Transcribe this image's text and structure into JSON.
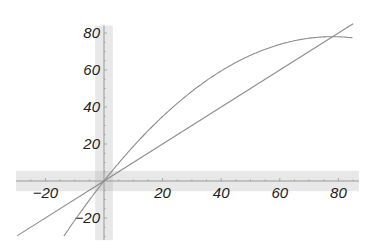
{
  "chart_data": {
    "type": "line",
    "title": "",
    "xlabel": "",
    "ylabel": "",
    "xlim": [
      -30,
      87
    ],
    "ylim": [
      -32,
      84
    ],
    "grid": false,
    "legend": null,
    "x_ticks": [
      -20,
      20,
      40,
      60,
      80
    ],
    "x_tick_labels": [
      "−20",
      "20",
      "40",
      "60",
      "80"
    ],
    "y_ticks": [
      -20,
      20,
      40,
      60,
      80
    ],
    "y_tick_labels": [
      "−20",
      "20",
      "40",
      "60",
      "80"
    ],
    "highlight_bands": [
      {
        "axis": "x",
        "from": -3,
        "to": 3,
        "color": "#e8e8e8"
      },
      {
        "axis": "y",
        "from": -5.5,
        "to": 5.5,
        "color": "#e8e8e8"
      }
    ],
    "series": [
      {
        "name": "line y = x",
        "style": "straight",
        "color": "#8c8c8c",
        "x": [
          -29.7,
          0,
          20,
          40,
          60,
          85
        ],
        "y": [
          -29.7,
          0,
          20,
          40,
          60,
          85
        ]
      },
      {
        "name": "curve y = 2x - x^2/78",
        "style": "curve",
        "color": "#8c8c8c",
        "x": [
          -13.7,
          -10,
          0,
          10,
          20,
          30,
          40,
          50,
          60,
          70,
          78,
          85
        ],
        "y": [
          -29.8,
          -21.3,
          0,
          18.7,
          34.9,
          48.5,
          59.5,
          67.9,
          73.8,
          77.2,
          78.0,
          77.4
        ]
      }
    ]
  }
}
